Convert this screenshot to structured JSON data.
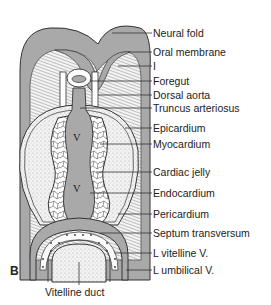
{
  "figure": {
    "panel_label": "B",
    "chamber_label_upper": "V",
    "chamber_label_lower": "V",
    "colors": {
      "tissue_gray": "#a9a9a9",
      "mesenchyme_light": "#ebebeb",
      "outline": "#333333",
      "background": "#ffffff"
    },
    "labels": [
      {
        "id": "neural-fold",
        "text": "Neural fold"
      },
      {
        "id": "oral-membrane",
        "text": "Oral membrane"
      },
      {
        "id": "i",
        "text": "I"
      },
      {
        "id": "foregut",
        "text": "Foregut"
      },
      {
        "id": "dorsal-aorta",
        "text": "Dorsal aorta"
      },
      {
        "id": "truncus-arteriosus",
        "text": "Truncus arteriosus"
      },
      {
        "id": "epicardium",
        "text": "Epicardium"
      },
      {
        "id": "myocardium",
        "text": "Myocardium"
      },
      {
        "id": "cardiac-jelly",
        "text": "Cardiac jelly"
      },
      {
        "id": "endocardium",
        "text": "Endocardium"
      },
      {
        "id": "pericardium",
        "text": "Pericardium"
      },
      {
        "id": "septum-transversum",
        "text": "Septum transversum"
      },
      {
        "id": "l-vitelline-v",
        "text": "L vitelline V."
      },
      {
        "id": "l-umbilical-v",
        "text": "L umbilical V."
      }
    ],
    "bottom_label": "Vitelline duct"
  }
}
